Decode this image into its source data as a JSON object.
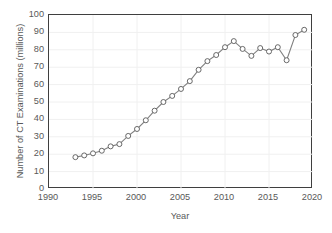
{
  "chart_data": {
    "type": "line",
    "title": "",
    "xlabel": "Year",
    "ylabel": "Number of CT Examinations (millions)",
    "xlim": [
      1990,
      2020
    ],
    "ylim": [
      0,
      100
    ],
    "xticks": [
      1990,
      1995,
      2000,
      2005,
      2010,
      2015,
      2020
    ],
    "yticks": [
      0,
      10,
      20,
      30,
      40,
      50,
      60,
      70,
      80,
      90,
      100
    ],
    "grid": "horizontal-and-vertical-light",
    "legend": "none",
    "marker": "open-circle",
    "line_color": "#808080",
    "marker_edge_color": "#595959",
    "marker_face_color": "#ffffff",
    "x": [
      1993,
      1994,
      1995,
      1996,
      1997,
      1998,
      1999,
      2000,
      2001,
      2002,
      2003,
      2004,
      2005,
      2006,
      2007,
      2008,
      2009,
      2010,
      2011,
      2012,
      2013,
      2014,
      2015,
      2016,
      2017,
      2018,
      2019
    ],
    "values": [
      18.3,
      19.3,
      20.5,
      22.0,
      24.5,
      25.8,
      30.5,
      34.5,
      39.5,
      45.0,
      50.0,
      53.5,
      57.5,
      62.0,
      68.5,
      73.5,
      77.0,
      81.5,
      85.0,
      80.5,
      76.5,
      81.0,
      79.0,
      81.5,
      74.0,
      88.5,
      91.5
    ],
    "series": [
      {
        "name": "CT Examinations",
        "values": [
          18.3,
          19.3,
          20.5,
          22.0,
          24.5,
          25.8,
          30.5,
          34.5,
          39.5,
          45.0,
          50.0,
          53.5,
          57.5,
          62.0,
          68.5,
          73.5,
          77.0,
          81.5,
          85.0,
          80.5,
          76.5,
          81.0,
          79.0,
          81.5,
          74.0,
          88.5,
          91.5
        ]
      }
    ]
  }
}
